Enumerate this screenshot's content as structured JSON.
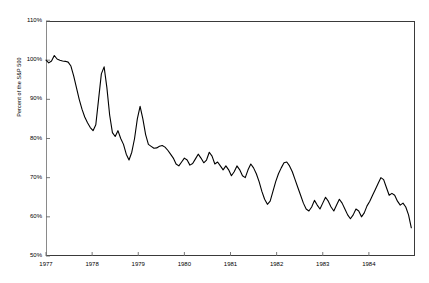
{
  "chart_data": {
    "type": "line",
    "title": "",
    "subtitle": "",
    "xlabel": "",
    "ylabel": "Percent of the S&P 500",
    "xlim": [
      1977.0,
      1985.0
    ],
    "ylim": [
      50,
      110
    ],
    "yticks": [
      50,
      60,
      70,
      80,
      90,
      100,
      110
    ],
    "ytick_labels": [
      "50%",
      "60%",
      "70%",
      "80%",
      "90%",
      "100%",
      "110%"
    ],
    "xticks": [
      1977,
      1978,
      1979,
      1980,
      1981,
      1982,
      1983,
      1984
    ],
    "xtick_labels": [
      "1977",
      "1978",
      "1979",
      "1980",
      "1981",
      "1982",
      "1983",
      "1984"
    ],
    "grid": false,
    "legend": null,
    "legend_position": "none",
    "line_color": "#000000",
    "line_width": 1.1,
    "background": "#ffffff",
    "frame_color": "#3a3a3a",
    "series": [
      {
        "name": "Percent of the S&P 500",
        "x": [
          1977.0,
          1977.06,
          1977.12,
          1977.18,
          1977.24,
          1977.3,
          1977.36,
          1977.42,
          1977.48,
          1977.54,
          1977.6,
          1977.66,
          1977.72,
          1977.78,
          1977.84,
          1977.9,
          1977.96,
          1978.02,
          1978.08,
          1978.14,
          1978.2,
          1978.26,
          1978.32,
          1978.38,
          1978.44,
          1978.5,
          1978.56,
          1978.62,
          1978.68,
          1978.74,
          1978.8,
          1978.86,
          1978.92,
          1978.98,
          1979.04,
          1979.1,
          1979.16,
          1979.22,
          1979.28,
          1979.34,
          1979.4,
          1979.46,
          1979.52,
          1979.58,
          1979.64,
          1979.7,
          1979.76,
          1979.82,
          1979.88,
          1979.94,
          1980.0,
          1980.06,
          1980.12,
          1980.18,
          1980.24,
          1980.3,
          1980.36,
          1980.42,
          1980.48,
          1980.54,
          1980.6,
          1980.66,
          1980.72,
          1980.78,
          1980.84,
          1980.9,
          1980.96,
          1981.02,
          1981.08,
          1981.14,
          1981.2,
          1981.26,
          1981.32,
          1981.38,
          1981.44,
          1981.5,
          1981.56,
          1981.62,
          1981.68,
          1981.74,
          1981.8,
          1981.86,
          1981.92,
          1981.98,
          1982.04,
          1982.1,
          1982.16,
          1982.22,
          1982.28,
          1982.34,
          1982.4,
          1982.46,
          1982.52,
          1982.58,
          1982.64,
          1982.7,
          1982.76,
          1982.82,
          1982.88,
          1982.94,
          1983.0,
          1983.06,
          1983.12,
          1983.18,
          1983.24,
          1983.3,
          1983.36,
          1983.42,
          1983.48,
          1983.54,
          1983.6,
          1983.66,
          1983.72,
          1983.78,
          1983.84,
          1983.9,
          1983.96,
          1984.02,
          1984.08,
          1984.14,
          1984.2,
          1984.26,
          1984.32,
          1984.38,
          1984.44,
          1984.5,
          1984.56,
          1984.62,
          1984.68,
          1984.74,
          1984.8,
          1984.86,
          1984.92
        ],
        "y": [
          100.0,
          99.3,
          99.8,
          101.2,
          100.3,
          100.0,
          99.8,
          99.7,
          99.5,
          98.5,
          96.0,
          93.0,
          90.0,
          87.5,
          85.5,
          84.0,
          82.8,
          82.0,
          83.5,
          90.0,
          96.5,
          98.3,
          93.0,
          86.0,
          81.5,
          80.5,
          82.0,
          80.0,
          78.5,
          76.0,
          74.5,
          76.5,
          80.0,
          85.0,
          88.2,
          85.0,
          81.0,
          78.5,
          78.0,
          77.5,
          77.6,
          78.0,
          78.2,
          77.8,
          77.0,
          76.0,
          75.0,
          73.5,
          73.0,
          74.0,
          75.0,
          74.5,
          73.2,
          73.6,
          74.8,
          76.0,
          75.0,
          73.8,
          74.5,
          76.5,
          75.5,
          73.5,
          74.0,
          73.0,
          72.0,
          73.0,
          72.0,
          70.5,
          71.5,
          73.0,
          72.0,
          70.5,
          70.0,
          72.0,
          73.5,
          72.5,
          71.0,
          69.0,
          66.5,
          64.5,
          63.2,
          64.0,
          66.5,
          69.0,
          71.0,
          72.5,
          73.8,
          74.0,
          73.0,
          71.5,
          69.5,
          67.5,
          65.5,
          63.5,
          62.0,
          61.5,
          62.5,
          64.2,
          63.0,
          62.0,
          63.5,
          65.0,
          64.0,
          62.5,
          61.5,
          63.0,
          64.5,
          63.5,
          62.0,
          60.5,
          59.5,
          60.5,
          62.0,
          61.5,
          60.0,
          61.0,
          62.8,
          64.0,
          65.5,
          67.0,
          68.5,
          70.0,
          69.5,
          67.5,
          65.5,
          66.0,
          65.5,
          64.0,
          63.0,
          63.5,
          62.5,
          60.5,
          57.2
        ]
      }
    ]
  }
}
